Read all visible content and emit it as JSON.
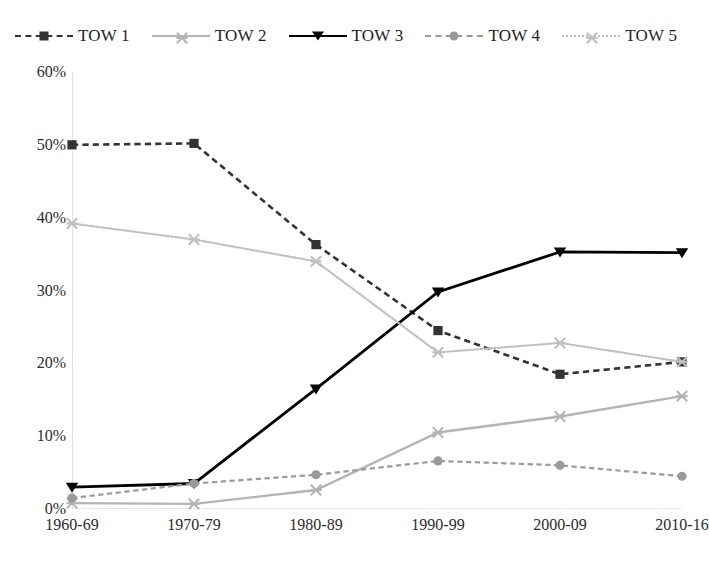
{
  "chart_data": {
    "type": "line",
    "title": "",
    "subtitle": "",
    "xlabel": "",
    "ylabel": "",
    "categories": [
      "1960-69",
      "1970-79",
      "1980-89",
      "1990-99",
      "2000-09",
      "2010-16"
    ],
    "ylim": [
      0,
      60
    ],
    "ytick_labels": [
      "0%",
      "10%",
      "20%",
      "30%",
      "40%",
      "50%",
      "60%"
    ],
    "ytick_values": [
      0,
      10,
      20,
      30,
      40,
      50,
      60
    ],
    "grid": false,
    "legend_position": "top",
    "series": [
      {
        "name": "TOW 1",
        "values": [
          50.0,
          50.2,
          36.3,
          24.5,
          18.5,
          20.2
        ],
        "color": "#333333",
        "marker": "square",
        "line_style": "dashed",
        "line_width": 2.6
      },
      {
        "name": "TOW 2",
        "values": [
          0.8,
          0.7,
          2.6,
          10.5,
          12.7,
          15.5
        ],
        "color": "#b4b4b4",
        "marker": "x",
        "line_style": "solid",
        "line_width": 2.4
      },
      {
        "name": "TOW 3",
        "values": [
          3.0,
          3.5,
          16.5,
          29.8,
          35.3,
          35.2
        ],
        "color": "#000000",
        "marker": "triangle-down",
        "line_style": "solid",
        "line_width": 2.8
      },
      {
        "name": "TOW 4",
        "values": [
          1.5,
          3.5,
          4.7,
          6.6,
          6.0,
          4.5
        ],
        "color": "#9a9a9a",
        "marker": "circle",
        "line_style": "dashed",
        "line_width": 2.2
      },
      {
        "name": "TOW 5",
        "values": [
          39.2,
          37.0,
          34.0,
          21.5,
          22.8,
          20.2
        ],
        "color": "#bfbfbf",
        "marker": "x",
        "line_style": "dotted",
        "line_width": 2.2
      }
    ]
  },
  "legend": {
    "items": [
      {
        "label": "TOW 1"
      },
      {
        "label": "TOW 2"
      },
      {
        "label": "TOW 3"
      },
      {
        "label": "TOW 4"
      },
      {
        "label": "TOW 5"
      }
    ]
  }
}
